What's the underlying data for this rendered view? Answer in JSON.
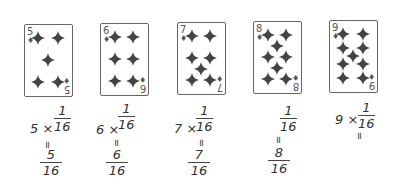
{
  "suit": "diamond-icon",
  "colors": {
    "ink": "#333333",
    "pip": "#444444",
    "card_border": "#666666"
  },
  "cards": [
    {
      "rank": "5",
      "pips": [
        [
          0.28,
          0.18
        ],
        [
          0.72,
          0.18
        ],
        [
          0.5,
          0.5
        ],
        [
          0.28,
          0.82
        ],
        [
          0.72,
          0.82
        ]
      ]
    },
    {
      "rank": "6",
      "pips": [
        [
          0.3,
          0.18
        ],
        [
          0.7,
          0.18
        ],
        [
          0.3,
          0.5
        ],
        [
          0.7,
          0.5
        ],
        [
          0.3,
          0.82
        ],
        [
          0.7,
          0.82
        ]
      ]
    },
    {
      "rank": "7",
      "pips": [
        [
          0.3,
          0.18
        ],
        [
          0.7,
          0.18
        ],
        [
          0.3,
          0.5
        ],
        [
          0.7,
          0.5
        ],
        [
          0.5,
          0.66
        ],
        [
          0.3,
          0.82
        ],
        [
          0.7,
          0.82
        ]
      ]
    },
    {
      "rank": "8",
      "pips": [
        [
          0.3,
          0.18
        ],
        [
          0.7,
          0.18
        ],
        [
          0.5,
          0.34
        ],
        [
          0.3,
          0.5
        ],
        [
          0.7,
          0.5
        ],
        [
          0.5,
          0.66
        ],
        [
          0.3,
          0.82
        ],
        [
          0.7,
          0.82
        ]
      ]
    },
    {
      "rank": "9",
      "pips": [
        [
          0.28,
          0.18
        ],
        [
          0.72,
          0.18
        ],
        [
          0.28,
          0.39
        ],
        [
          0.72,
          0.39
        ],
        [
          0.5,
          0.5
        ],
        [
          0.28,
          0.61
        ],
        [
          0.72,
          0.61
        ],
        [
          0.28,
          0.82
        ],
        [
          0.72,
          0.82
        ]
      ]
    }
  ],
  "expressions": [
    {
      "multiplier": "5 ×",
      "unit_num": "1",
      "unit_den": "16",
      "equals": "=",
      "result_num": "5",
      "result_den": "16"
    },
    {
      "multiplier": "6 ×",
      "unit_num": "1",
      "unit_den": "16",
      "equals": "=",
      "result_num": "6",
      "result_den": "16"
    },
    {
      "multiplier": "7 ×",
      "unit_num": "1",
      "unit_den": "16",
      "equals": "=",
      "result_num": "7",
      "result_den": "16"
    },
    {
      "multiplier": "",
      "unit_num": "1",
      "unit_den": "16",
      "equals": "=",
      "result_num": "8",
      "result_den": "16"
    },
    {
      "multiplier": "9 ×",
      "unit_num": "1",
      "unit_den": "16",
      "equals": "=",
      "result_num": "",
      "result_den": ""
    }
  ]
}
